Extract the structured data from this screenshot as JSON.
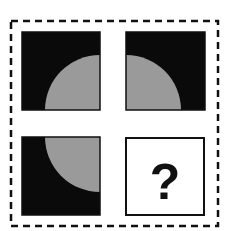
{
  "puzzle": {
    "type": "2x2 matrix reasoning",
    "colors": {
      "background": "#ffffff",
      "square": "#0a0a0a",
      "quarter_circle": "#9a9a9a",
      "border": "#111111",
      "answer_box_bg": "#ffffff"
    },
    "cells": [
      {
        "position": "top-left",
        "fill": "black",
        "quarter_circle_corner": "bottom-right"
      },
      {
        "position": "top-right",
        "fill": "black",
        "quarter_circle_corner": "bottom-left"
      },
      {
        "position": "bottom-left",
        "fill": "black",
        "quarter_circle_corner": "top-right"
      },
      {
        "position": "bottom-right",
        "fill": "white",
        "label": "?"
      }
    ]
  }
}
